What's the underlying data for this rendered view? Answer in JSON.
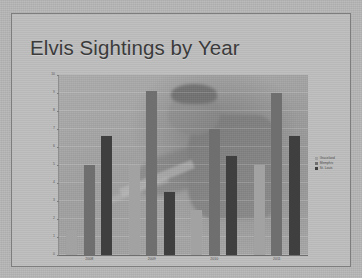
{
  "slide": {
    "title": "Elvis Sightings by Year"
  },
  "chart_data": {
    "type": "bar",
    "title": "Elvis Sightings by Year",
    "xlabel": "",
    "ylabel": "",
    "ylim": [
      0,
      10
    ],
    "yticks": [
      "0",
      "1",
      "2",
      "3",
      "4",
      "5",
      "6",
      "7",
      "8",
      "9",
      "10"
    ],
    "grid": true,
    "legend_position": "right",
    "categories": [
      "2008",
      "2009",
      "2010",
      "2011"
    ],
    "series": [
      {
        "name": "Graceland",
        "color": "#a2a2a2",
        "values": [
          1.4,
          5.0,
          2.5,
          5.0
        ]
      },
      {
        "name": "Memphis",
        "color": "#6f6f6f",
        "values": [
          5.0,
          9.1,
          7.0,
          9.0
        ]
      },
      {
        "name": "St. Louis",
        "color": "#3f3f3f",
        "values": [
          6.6,
          3.5,
          5.5,
          6.6
        ]
      }
    ]
  }
}
